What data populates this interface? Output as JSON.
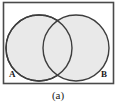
{
  "figure": {
    "caption": "(a)",
    "type": "venn-diagram",
    "labels": {
      "left_set": "A",
      "right_set": "B"
    },
    "colors": {
      "circle_fill": "#e9e9e9",
      "circle_stroke": "#3d3d3d",
      "rect_stroke": "#4a4a4a",
      "rect_fill": "#ffffff",
      "text": "#1a1a1a",
      "background": "#ffffff"
    },
    "geometry": {
      "rect": {
        "x": 3,
        "y": 2,
        "width": 110,
        "height": 82
      },
      "left_circle": {
        "cx": 39,
        "cy": 48,
        "r": 33
      },
      "right_circle": {
        "cx": 76,
        "cy": 48,
        "r": 33
      }
    }
  }
}
